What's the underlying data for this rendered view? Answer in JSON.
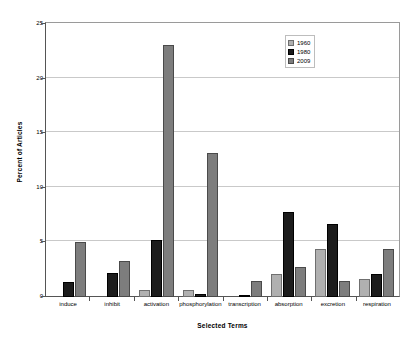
{
  "chart_data": {
    "type": "bar",
    "title": "",
    "xlabel": "Selected Terms",
    "ylabel": "Percent of Articles",
    "ylim": [
      0,
      25
    ],
    "yticks": [
      0,
      5,
      10,
      15,
      20,
      25
    ],
    "grid": true,
    "legend_position": "top-right",
    "categories": [
      "induce",
      "inhibit",
      "activation",
      "phosphorylation",
      "transcription",
      "absorption",
      "excretion",
      "respiration"
    ],
    "series": [
      {
        "name": "1960",
        "color": "#b0b0b0",
        "values": [
          0,
          0,
          0.6,
          0.6,
          0,
          2.1,
          4.4,
          1.7
        ]
      },
      {
        "name": "1980",
        "color": "#1c1c1c",
        "values": [
          1.35,
          2.2,
          5.2,
          0.3,
          0.15,
          7.8,
          6.7,
          2.1
        ]
      },
      {
        "name": "2009",
        "color": "#7d7d7d",
        "values": [
          5.1,
          3.3,
          23.2,
          13.2,
          1.5,
          2.8,
          1.5,
          4.4
        ]
      }
    ]
  }
}
